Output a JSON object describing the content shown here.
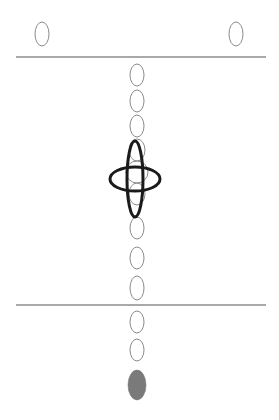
{
  "diagram": {
    "width": 279,
    "height": 420,
    "colors": {
      "background": "#ffffff",
      "outline": "#8a8a8a",
      "line": "#8c8c8c",
      "focus": "#1a1a1a",
      "filled": "#7a7a7a"
    },
    "lines": [
      {
        "name": "upper-horizontal-line",
        "x1": 16,
        "y1": 57,
        "x2": 266,
        "y2": 57
      },
      {
        "name": "lower-horizontal-line",
        "x1": 16,
        "y1": 305,
        "x2": 266,
        "y2": 305
      }
    ],
    "top_ellipses": [
      {
        "name": "top-left-ellipse",
        "cx": 42,
        "cy": 34,
        "rx": 7,
        "ry": 12
      },
      {
        "name": "top-right-ellipse",
        "cx": 236,
        "cy": 34,
        "rx": 7,
        "ry": 12
      }
    ],
    "column_ellipses": [
      {
        "cx": 137,
        "cy": 75,
        "rx": 7,
        "ry": 11
      },
      {
        "cx": 137,
        "cy": 101,
        "rx": 7,
        "ry": 11
      },
      {
        "cx": 137,
        "cy": 126,
        "rx": 7,
        "ry": 11
      },
      {
        "cx": 137,
        "cy": 150,
        "rx": 8,
        "ry": 11
      },
      {
        "cx": 137,
        "cy": 172,
        "rx": 11,
        "ry": 11
      },
      {
        "cx": 137,
        "cy": 194,
        "rx": 8,
        "ry": 11
      },
      {
        "cx": 137,
        "cy": 228,
        "rx": 7,
        "ry": 11
      },
      {
        "cx": 137,
        "cy": 258,
        "rx": 7,
        "ry": 11
      },
      {
        "cx": 137,
        "cy": 288,
        "rx": 7,
        "ry": 12
      },
      {
        "cx": 137,
        "cy": 322,
        "rx": 7,
        "ry": 11
      },
      {
        "cx": 137,
        "cy": 350,
        "rx": 7,
        "ry": 11
      }
    ],
    "focus_symbol": {
      "vertical": {
        "cx": 135,
        "cy": 179,
        "rx": 8,
        "ry": 38
      },
      "horizontal": {
        "cx": 135,
        "cy": 179,
        "rx": 25,
        "ry": 12
      },
      "stroke_width": 3
    },
    "filled_ellipse": {
      "cx": 137,
      "cy": 385,
      "rx": 9,
      "ry": 15
    }
  }
}
